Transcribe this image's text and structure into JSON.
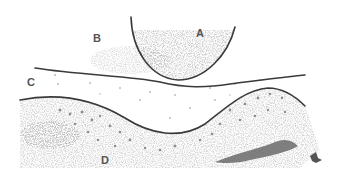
{
  "diagram": {
    "type": "histological-sketch",
    "regions": [
      {
        "id": "A",
        "label": "A",
        "x": 200,
        "y": 37
      },
      {
        "id": "B",
        "label": "B",
        "x": 97,
        "y": 42
      },
      {
        "id": "C",
        "label": "C",
        "x": 31,
        "y": 86
      },
      {
        "id": "D",
        "label": "D",
        "x": 105,
        "y": 164
      }
    ],
    "colors": {
      "line": "#3a3a3a",
      "label": "#555555",
      "stipple_light": "#c8c8c8",
      "stipple_dark": "#7a7a7a",
      "dark_mass": "#6a6a6a"
    }
  }
}
